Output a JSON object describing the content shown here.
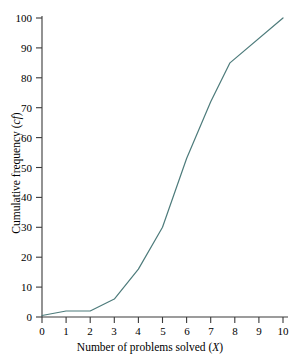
{
  "chart_data": {
    "type": "line",
    "title": "",
    "subtitle": "",
    "xlabel": "Number of problems solved (X)",
    "xlabel_plain": "Number of problems solved",
    "xlabel_symbol": "X",
    "ylabel": "Cumulative frequency (cf)",
    "ylabel_plain": "Cumulative frequency",
    "ylabel_symbol": "cf",
    "xlim": [
      0,
      10
    ],
    "ylim": [
      0,
      100
    ],
    "xticks": [
      0,
      1,
      2,
      3,
      4,
      5,
      6,
      7,
      8,
      9,
      10
    ],
    "yticks": [
      0,
      10,
      20,
      30,
      40,
      50,
      60,
      70,
      80,
      90,
      100
    ],
    "xtick_labels": [
      "0",
      "1",
      "2",
      "3",
      "4",
      "5",
      "6",
      "7",
      "8",
      "9",
      "10"
    ],
    "ytick_labels": [
      "0",
      "10",
      "20",
      "30",
      "40",
      "50",
      "60",
      "70",
      "80",
      "90",
      "100"
    ],
    "grid": false,
    "legend": false,
    "legend_position": "none",
    "series": [
      {
        "name": "Cumulative frequency",
        "color": "#4d7b7b",
        "line_width": 1.2,
        "markers": false,
        "x": [
          0,
          1,
          2,
          3,
          4,
          5,
          6,
          7,
          7.8,
          10
        ],
        "values": [
          0.5,
          2,
          2,
          6,
          16,
          30,
          53,
          72,
          85,
          100
        ]
      }
    ],
    "annotations": []
  },
  "axis": {
    "line_color": "#3a3a3a",
    "tick_color": "#3a3a3a"
  }
}
